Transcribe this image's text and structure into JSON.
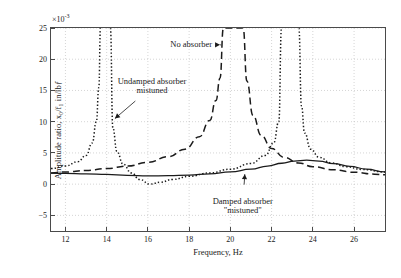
{
  "chart_data": {
    "type": "line",
    "title": "",
    "xlabel": "Frequency, Hz",
    "ylabel": "Amplitude ratio, x₀/f₁ in/lbƒ",
    "y_multiplier": "×10",
    "y_multiplier_exp": "-3",
    "xlim": [
      11.3,
      27.5
    ],
    "ylim": [
      -7.5,
      25
    ],
    "xticks": [
      12,
      14,
      16,
      18,
      20,
      22,
      24,
      26
    ],
    "yticks": [
      25,
      20,
      15,
      10,
      5,
      0,
      -5
    ],
    "grid": true,
    "legend_position": "none",
    "annotations": [
      {
        "name": "no-absorber",
        "lines": [
          "No absorber"
        ],
        "x": 18.1,
        "y": 22.3,
        "arrow_to_x": 19.5,
        "arrow_to_y": 22.3
      },
      {
        "name": "undamped-absorber-mistuned",
        "lines": [
          "Undamped absorber",
          "mistuned"
        ],
        "x": 16.2,
        "y": 15.6,
        "arrow_to_x": 14.4,
        "arrow_to_y": 10.5
      },
      {
        "name": "damped-absorber-mistuned",
        "lines": [
          "Damped absorber",
          "\"mistuned\""
        ],
        "x": 20.6,
        "y": -3.6,
        "arrow_to_x": 20.7,
        "arrow_to_y": 1.6
      }
    ],
    "series": [
      {
        "name": "No absorber",
        "style": "dashed",
        "resonance_hz": 20.1,
        "asymptotes_hz": [
          20.1
        ],
        "points": [
          [
            11.3,
            1.8
          ],
          [
            12.0,
            1.95
          ],
          [
            13.0,
            2.2
          ],
          [
            14.0,
            2.5
          ],
          [
            15.0,
            2.9
          ],
          [
            16.0,
            3.5
          ],
          [
            17.0,
            4.4
          ],
          [
            17.8,
            5.6
          ],
          [
            18.5,
            7.6
          ],
          [
            19.0,
            10.2
          ],
          [
            19.3,
            13.4
          ],
          [
            19.5,
            17.0
          ],
          [
            19.66,
            25.0
          ],
          [
            20.62,
            25.0
          ],
          [
            20.8,
            16.5
          ],
          [
            21.1,
            11.0
          ],
          [
            21.5,
            7.8
          ],
          [
            22.0,
            5.7
          ],
          [
            22.6,
            4.3
          ],
          [
            23.3,
            3.4
          ],
          [
            24.0,
            2.8
          ],
          [
            25.0,
            2.3
          ],
          [
            26.0,
            1.9
          ],
          [
            27.0,
            1.6
          ],
          [
            27.5,
            1.5
          ]
        ]
      },
      {
        "name": "Undamped absorber mistuned",
        "style": "dotted",
        "asymptotes_hz": [
          13.72,
          14.2,
          22.5,
          23.3
        ],
        "antiresonance_hz": 16.1,
        "points_branch1": [
          [
            11.3,
            2.5
          ],
          [
            12.0,
            2.9
          ],
          [
            12.6,
            3.6
          ],
          [
            13.0,
            4.6
          ],
          [
            13.3,
            6.6
          ],
          [
            13.5,
            10.0
          ],
          [
            13.62,
            15.5
          ],
          [
            13.7,
            25.0
          ]
        ],
        "points_branch2": [
          [
            14.18,
            25.0
          ],
          [
            14.3,
            9.0
          ],
          [
            14.5,
            5.2
          ],
          [
            14.8,
            3.2
          ],
          [
            15.2,
            1.8
          ],
          [
            15.6,
            0.75
          ],
          [
            16.1,
            0.0
          ],
          [
            16.6,
            0.3
          ],
          [
            17.2,
            0.75
          ],
          [
            18.0,
            1.25
          ],
          [
            19.0,
            1.8
          ],
          [
            20.0,
            2.4
          ],
          [
            21.0,
            3.3
          ],
          [
            21.7,
            4.6
          ],
          [
            22.1,
            6.6
          ],
          [
            22.35,
            10.0
          ],
          [
            22.48,
            25.0
          ]
        ],
        "points_branch3": [
          [
            23.32,
            25.0
          ],
          [
            23.45,
            12.5
          ],
          [
            23.6,
            8.2
          ],
          [
            23.9,
            5.6
          ],
          [
            24.3,
            4.3
          ],
          [
            24.9,
            3.4
          ],
          [
            25.6,
            2.8
          ],
          [
            26.4,
            2.35
          ],
          [
            27.5,
            1.95
          ]
        ]
      },
      {
        "name": "Damped absorber mistuned",
        "style": "solid",
        "peak_hz": 23.7,
        "peak_value": 3.85,
        "points": [
          [
            11.3,
            1.75
          ],
          [
            12.0,
            1.72
          ],
          [
            13.0,
            1.65
          ],
          [
            14.0,
            1.55
          ],
          [
            15.0,
            1.42
          ],
          [
            16.0,
            1.32
          ],
          [
            17.0,
            1.35
          ],
          [
            18.0,
            1.45
          ],
          [
            19.0,
            1.65
          ],
          [
            20.0,
            1.95
          ],
          [
            21.0,
            2.4
          ],
          [
            21.8,
            2.9
          ],
          [
            22.5,
            3.35
          ],
          [
            23.1,
            3.7
          ],
          [
            23.7,
            3.85
          ],
          [
            24.3,
            3.7
          ],
          [
            25.0,
            3.3
          ],
          [
            25.8,
            2.85
          ],
          [
            26.6,
            2.4
          ],
          [
            27.5,
            1.95
          ]
        ]
      }
    ]
  }
}
